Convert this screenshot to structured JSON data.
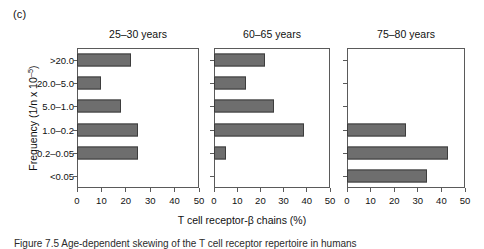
{
  "figure": {
    "panel_letter": "(c)",
    "y_axis_title_main": "Frequency (1/n x 10",
    "y_axis_title_exponent": "–5",
    "y_axis_title_close": ")",
    "x_axis_title": "T cell receptor-β chains (%)",
    "caption_line": "Figure  7.5   Age-dependent skewing of  the  T  cell  receptor  repertoire  in  humans"
  },
  "chart_data": {
    "type": "bar",
    "orientation": "horizontal",
    "title": "",
    "xlabel": "T cell receptor-β chains (%)",
    "ylabel": "Frequency (1/n x 10–5)",
    "xlim": [
      0,
      50
    ],
    "xticks": [
      0,
      10,
      20,
      30,
      40,
      50
    ],
    "xtick_labels": [
      "0",
      "10",
      "20",
      "30",
      "40",
      "50"
    ],
    "categories": [
      ">20.0",
      "20.0–5.0",
      "5.0–1.0",
      "1.0–0.2",
      "0.2–0.05",
      "<0.05"
    ],
    "grid": false,
    "legend": "none",
    "bar_color": "#6e6e6e",
    "bar_edge_color": "#3d3d3d",
    "panels": [
      {
        "title": "25–30 years",
        "values": [
          22,
          10,
          18,
          25,
          25,
          0
        ]
      },
      {
        "title": "60–65 years",
        "values": [
          22,
          14,
          26,
          39,
          5,
          0
        ]
      },
      {
        "title": "75–80 years",
        "values": [
          0,
          0,
          0,
          25,
          43,
          34
        ]
      }
    ]
  }
}
